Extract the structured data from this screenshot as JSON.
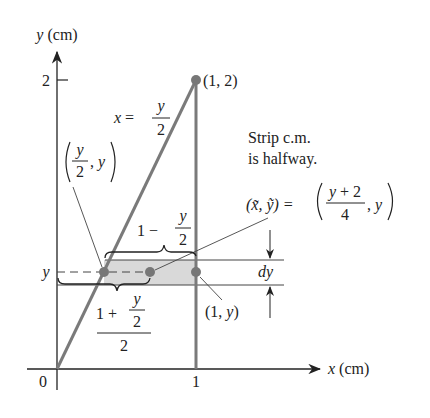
{
  "figure": {
    "axes": {
      "x_label_var": "x",
      "x_label_unit": "(cm)",
      "y_label_var": "y",
      "y_label_unit": "(cm)",
      "origin_label": "0",
      "x_tick_label": "1",
      "y_tick_label": "2",
      "y_strip_label": "y"
    },
    "curve_label": {
      "lhs": "x =",
      "num": "y",
      "den": "2"
    },
    "points": {
      "top_right": "(1, 2)",
      "left_point_num": "y",
      "left_point_den": "2",
      "left_point_tail": ", y",
      "right_point": "(1, y)"
    },
    "annotation": {
      "line1": "Strip c.m.",
      "line2": "is halfway.",
      "centroid_lhs": "(x̃, ỹ) =",
      "centroid_num": "y + 2",
      "centroid_den": "4",
      "centroid_tail": ", y"
    },
    "brace_top": {
      "prefix": "1 −",
      "num": "y",
      "den": "2"
    },
    "brace_bottom": {
      "prefix": "1 +",
      "num": "y",
      "den": "2",
      "outer_den": "2"
    },
    "dy_label": "dy",
    "colors": {
      "curve": "#7a7a7a",
      "strip_fill": "#d9d9d9",
      "point": "#777777",
      "axis": "#222222"
    }
  }
}
